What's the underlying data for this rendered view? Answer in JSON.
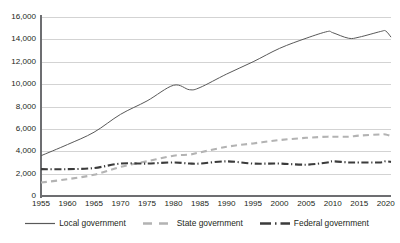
{
  "chart_data": {
    "type": "line",
    "title": "",
    "xlabel": "",
    "ylabel": "",
    "xlim": [
      1955,
      2021
    ],
    "ylim": [
      0,
      16000
    ],
    "grid": true,
    "legend_position": "bottom",
    "y_ticks": [
      "0",
      "2,000",
      "4,000",
      "6,000",
      "8,000",
      "10,000",
      "12,000",
      "14,000",
      "16,000"
    ],
    "y_tick_values": [
      0,
      2000,
      4000,
      6000,
      8000,
      10000,
      12000,
      14000,
      16000
    ],
    "x_ticks": [
      "1955",
      "1960",
      "1965",
      "1970",
      "1975",
      "1980",
      "1985",
      "1990",
      "1995",
      "2000",
      "2005",
      "2010",
      "2015",
      "2020"
    ],
    "x_tick_values": [
      1955,
      1960,
      1965,
      1970,
      1975,
      1980,
      1985,
      1990,
      1995,
      2000,
      2005,
      2010,
      2015,
      2020
    ],
    "x": [
      1955,
      1960,
      1965,
      1970,
      1975,
      1980,
      1983,
      1985,
      1990,
      1995,
      2000,
      2005,
      2009,
      2010,
      2013,
      2015,
      2019,
      2020,
      2021
    ],
    "series": [
      {
        "name": "Local government",
        "style": "solid",
        "color": "#595959",
        "values": [
          3600,
          4600,
          5700,
          7300,
          8500,
          9900,
          9500,
          9700,
          10900,
          12000,
          13200,
          14100,
          14700,
          14600,
          14100,
          14200,
          14700,
          14750,
          14200
        ]
      },
      {
        "name": "State government",
        "style": "dashed",
        "color": "#b3b3b3",
        "values": [
          1200,
          1500,
          1900,
          2600,
          3100,
          3600,
          3700,
          3900,
          4400,
          4700,
          5000,
          5200,
          5300,
          5300,
          5300,
          5400,
          5500,
          5500,
          5350
        ]
      },
      {
        "name": "Federal government",
        "style": "dash-dot",
        "color": "#3b3b3b",
        "values": [
          2400,
          2400,
          2500,
          2900,
          2900,
          3000,
          2900,
          2900,
          3100,
          2900,
          2900,
          2800,
          3000,
          3100,
          3000,
          3000,
          3000,
          3100,
          3050
        ]
      }
    ]
  },
  "legend": {
    "items": [
      {
        "label": "Local government"
      },
      {
        "label": "State government"
      },
      {
        "label": "Federal government"
      }
    ]
  },
  "colors": {
    "local": "#595959",
    "state": "#b3b3b3",
    "federal": "#3b3b3b",
    "axis": "#6d6e71",
    "grid": "#d3d3d3",
    "text": "#231f20"
  }
}
